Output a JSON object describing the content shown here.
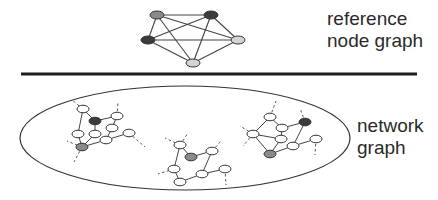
{
  "labels": {
    "reference": [
      "reference",
      "node graph"
    ],
    "network": [
      "network",
      "graph"
    ]
  },
  "colors": {
    "dark": "#3c3c3c",
    "mid": "#8a8a8a",
    "light": "#d4d4d4",
    "white": "#ffffff",
    "edge": "#444444"
  },
  "reference_graph": {
    "nodes": [
      {
        "id": "a",
        "fill": "mid"
      },
      {
        "id": "b",
        "fill": "dark"
      },
      {
        "id": "c",
        "fill": "dark"
      },
      {
        "id": "d",
        "fill": "light"
      },
      {
        "id": "e",
        "fill": "light"
      }
    ],
    "edges": [
      [
        "a",
        "b"
      ],
      [
        "a",
        "c"
      ],
      [
        "a",
        "d"
      ],
      [
        "a",
        "e"
      ],
      [
        "b",
        "c"
      ],
      [
        "b",
        "d"
      ],
      [
        "b",
        "e"
      ],
      [
        "c",
        "d"
      ],
      [
        "c",
        "e"
      ],
      [
        "d",
        "e"
      ]
    ]
  },
  "network_clusters": [
    {
      "name": "left",
      "nodes": [
        {
          "id": "n1",
          "fill": "white"
        },
        {
          "id": "n2",
          "fill": "dark"
        },
        {
          "id": "n3",
          "fill": "white"
        },
        {
          "id": "n4",
          "fill": "white"
        },
        {
          "id": "n5",
          "fill": "white"
        },
        {
          "id": "n6",
          "fill": "white"
        },
        {
          "id": "n7",
          "fill": "white"
        },
        {
          "id": "n8",
          "fill": "white"
        },
        {
          "id": "n9",
          "fill": "mid"
        }
      ],
      "edges": [
        [
          "n1",
          "n2"
        ],
        [
          "n1",
          "n5"
        ],
        [
          "n2",
          "n3"
        ],
        [
          "n2",
          "n6"
        ],
        [
          "n3",
          "n4"
        ],
        [
          "n4",
          "n7"
        ],
        [
          "n5",
          "n9"
        ],
        [
          "n6",
          "n9"
        ],
        [
          "n7",
          "n8"
        ],
        [
          "n7",
          "n9"
        ]
      ]
    },
    {
      "name": "middle",
      "nodes": [
        {
          "id": "m1",
          "fill": "white"
        },
        {
          "id": "m2",
          "fill": "mid"
        },
        {
          "id": "m3",
          "fill": "white"
        },
        {
          "id": "m4",
          "fill": "white"
        },
        {
          "id": "m5",
          "fill": "white"
        },
        {
          "id": "m6",
          "fill": "white"
        },
        {
          "id": "m7",
          "fill": "white"
        }
      ],
      "edges": [
        [
          "m1",
          "m2"
        ],
        [
          "m1",
          "m4"
        ],
        [
          "m2",
          "m3"
        ],
        [
          "m3",
          "m5"
        ],
        [
          "m4",
          "m7"
        ],
        [
          "m5",
          "m7"
        ],
        [
          "m5",
          "m6"
        ]
      ]
    },
    {
      "name": "right",
      "nodes": [
        {
          "id": "r1",
          "fill": "white"
        },
        {
          "id": "r2",
          "fill": "dark"
        },
        {
          "id": "r3",
          "fill": "white"
        },
        {
          "id": "r4",
          "fill": "white"
        },
        {
          "id": "r5",
          "fill": "white"
        },
        {
          "id": "r6",
          "fill": "white"
        },
        {
          "id": "r7",
          "fill": "white"
        },
        {
          "id": "r8",
          "fill": "mid"
        }
      ],
      "edges": [
        [
          "r1",
          "r3"
        ],
        [
          "r1",
          "r4"
        ],
        [
          "r3",
          "r2"
        ],
        [
          "r3",
          "r5"
        ],
        [
          "r4",
          "r5"
        ],
        [
          "r4",
          "r8"
        ],
        [
          "r5",
          "r8"
        ],
        [
          "r2",
          "r6"
        ],
        [
          "r6",
          "r8"
        ],
        [
          "r6",
          "r7"
        ]
      ]
    }
  ]
}
